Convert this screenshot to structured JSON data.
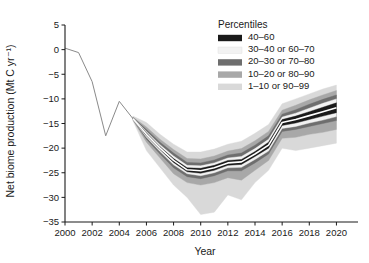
{
  "chart_data": {
    "type": "area",
    "title": "",
    "xlabel": "Year",
    "ylabel": "Net biome production (Mt C yr⁻¹)",
    "xlim": [
      2000,
      2021
    ],
    "ylim": [
      -35,
      5
    ],
    "xticks": [
      2000,
      2002,
      2004,
      2006,
      2008,
      2010,
      2012,
      2014,
      2016,
      2018,
      2020
    ],
    "yticks": [
      5,
      0,
      -5,
      -10,
      -15,
      -20,
      -25,
      -30,
      -35
    ],
    "grid": false,
    "legend_position": "upper-right",
    "legend_title": "Percentiles",
    "legend_entries": [
      {
        "label": "40–60",
        "color": "#1a1a1a"
      },
      {
        "label": "30–40 or 60–70",
        "color": "#f2f2f2"
      },
      {
        "label": "20–30 or 70–80",
        "color": "#6e6e6e"
      },
      {
        "label": "10–20 or 80–90",
        "color": "#a8a8a8"
      },
      {
        "label": "1–10 or 90–99",
        "color": "#d9d9d9"
      }
    ],
    "x": [
      2000,
      2001,
      2002,
      2003,
      2004,
      2005,
      2006,
      2007,
      2008,
      2009,
      2010,
      2011,
      2012,
      2013,
      2014,
      2015,
      2016,
      2017,
      2018,
      2019,
      2020
    ],
    "historical_x": [
      2000,
      2001,
      2002,
      2003,
      2004,
      2005
    ],
    "historical_values": [
      0.3,
      -0.6,
      -6.5,
      -17.5,
      -10.5,
      -14.0
    ],
    "series": [
      {
        "name": "p1",
        "values": [
          null,
          null,
          null,
          null,
          null,
          -14.4,
          -20.5,
          -24.0,
          -27.5,
          -30.0,
          -33.5,
          -33.0,
          -29.5,
          -30.5,
          -27.0,
          -24.5,
          -20.0,
          -20.5,
          -20.0,
          -19.5,
          -19.0
        ]
      },
      {
        "name": "p10",
        "values": [
          null,
          null,
          null,
          null,
          null,
          -14.3,
          -18.8,
          -22.0,
          -25.2,
          -27.0,
          -27.5,
          -27.0,
          -26.0,
          -26.5,
          -24.5,
          -22.5,
          -18.0,
          -17.8,
          -17.2,
          -16.8,
          -16.2
        ]
      },
      {
        "name": "p20",
        "values": [
          null,
          null,
          null,
          null,
          null,
          -14.2,
          -18.2,
          -21.2,
          -24.0,
          -25.8,
          -26.2,
          -25.6,
          -24.6,
          -24.6,
          -23.0,
          -21.2,
          -16.6,
          -16.2,
          -15.6,
          -15.0,
          -14.4
        ]
      },
      {
        "name": "p30",
        "values": [
          null,
          null,
          null,
          null,
          null,
          -14.1,
          -17.8,
          -20.7,
          -23.4,
          -25.2,
          -25.6,
          -25.0,
          -24.0,
          -23.9,
          -22.3,
          -20.6,
          -16.0,
          -15.6,
          -14.9,
          -14.3,
          -13.6
        ]
      },
      {
        "name": "p40",
        "values": [
          null,
          null,
          null,
          null,
          null,
          -14.05,
          -17.5,
          -20.3,
          -22.9,
          -24.8,
          -25.1,
          -24.5,
          -23.5,
          -23.3,
          -21.7,
          -20.0,
          -15.4,
          -14.9,
          -14.2,
          -13.5,
          -12.8
        ]
      },
      {
        "name": "p50",
        "values": [
          null,
          null,
          null,
          null,
          null,
          -14.0,
          -17.2,
          -20.0,
          -22.5,
          -24.4,
          -24.6,
          -24.0,
          -23.0,
          -22.8,
          -21.2,
          -19.4,
          -14.8,
          -14.2,
          -13.4,
          -12.6,
          -11.8
        ]
      },
      {
        "name": "p60",
        "values": [
          null,
          null,
          null,
          null,
          null,
          -13.95,
          -16.9,
          -19.7,
          -22.1,
          -24.0,
          -24.1,
          -23.5,
          -22.5,
          -22.3,
          -20.7,
          -18.8,
          -14.2,
          -13.5,
          -12.6,
          -11.7,
          -10.8
        ]
      },
      {
        "name": "p70",
        "values": [
          null,
          null,
          null,
          null,
          null,
          -13.9,
          -16.6,
          -19.3,
          -21.6,
          -23.5,
          -23.6,
          -23.0,
          -22.0,
          -21.7,
          -20.1,
          -18.2,
          -13.7,
          -12.9,
          -11.9,
          -10.9,
          -10.0
        ]
      },
      {
        "name": "p80",
        "values": [
          null,
          null,
          null,
          null,
          null,
          -13.8,
          -16.2,
          -18.8,
          -21.0,
          -22.9,
          -23.0,
          -22.4,
          -21.4,
          -21.0,
          -19.4,
          -17.5,
          -13.1,
          -12.2,
          -11.1,
          -10.1,
          -9.2
        ]
      },
      {
        "name": "p90",
        "values": [
          null,
          null,
          null,
          null,
          null,
          -13.7,
          -15.7,
          -18.2,
          -20.3,
          -22.1,
          -22.2,
          -21.6,
          -20.6,
          -20.1,
          -18.5,
          -16.6,
          -12.3,
          -11.3,
          -10.2,
          -9.2,
          -8.3
        ]
      },
      {
        "name": "p99",
        "values": [
          null,
          null,
          null,
          null,
          null,
          -13.5,
          -14.8,
          -17.2,
          -19.2,
          -20.8,
          -20.8,
          -20.2,
          -19.2,
          -18.6,
          -17.0,
          -15.2,
          -11.0,
          -10.0,
          -9.0,
          -8.0,
          -7.2
        ]
      }
    ],
    "bands": [
      {
        "name": "1–10 or 90–99",
        "lower": "p1",
        "upper": "p99",
        "color": "#d9d9d9"
      },
      {
        "name": "10–20 or 80–90",
        "lower": "p10",
        "upper": "p90",
        "color": "#a8a8a8"
      },
      {
        "name": "20–30 or 70–80",
        "lower": "p20",
        "upper": "p80",
        "color": "#6e6e6e"
      },
      {
        "name": "30–40 or 60–70",
        "lower": "p30",
        "upper": "p70",
        "color": "#f2f2f2"
      },
      {
        "name": "40–60",
        "lower": "p40",
        "upper": "p60",
        "color": "#1a1a1a"
      }
    ],
    "median_series": "p50",
    "median_color": "#ffffff"
  }
}
